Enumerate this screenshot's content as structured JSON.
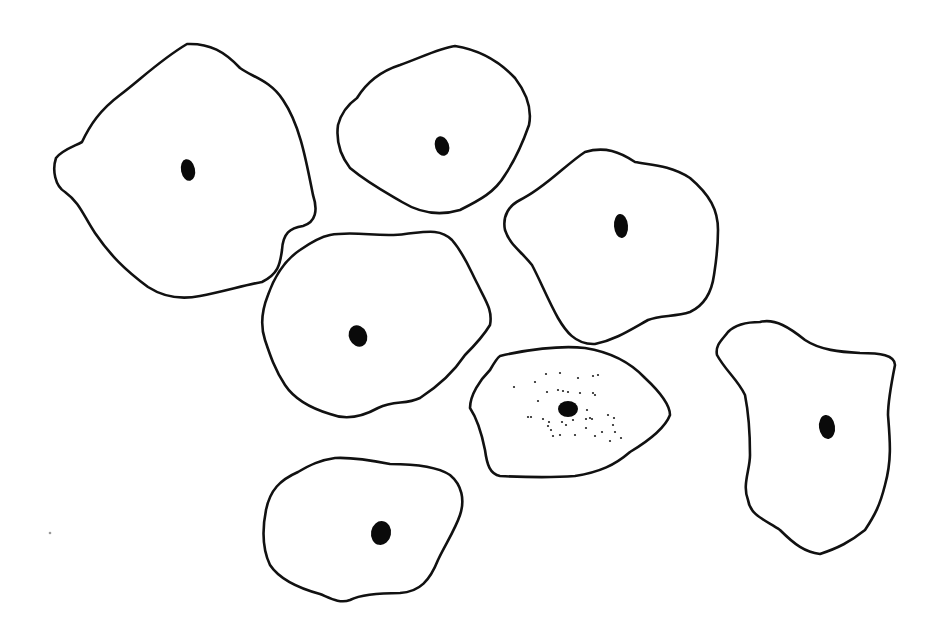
{
  "figure": {
    "width": 943,
    "height": 632,
    "background": "#ffffff",
    "line_color": "#111111",
    "cells": [
      {
        "id": "cell-top-left",
        "outline": "M 187,44 C 210,43 225,52 240,68 C 252,77 270,80 283,100 C 300,125 306,160 313,195 C 318,210 316,222 303,226 C 290,228 283,233 282,250 C 280,265 278,274 262,282 C 245,285 222,292 200,296 C 180,300 162,296 148,287 C 125,270 110,255 95,233 C 83,215 80,203 65,192 C 55,186 52,170 56,158 C 62,150 75,146 82,142 C 90,125 100,110 120,95 C 140,80 160,60 187,44 Z",
        "nucleus": {
          "cx": 188,
          "cy": 170,
          "rx": 7,
          "ry": 11,
          "rotate": -12
        },
        "granules": []
      },
      {
        "id": "cell-top-center",
        "outline": "M 455,46 C 480,50 500,62 515,78 C 528,95 532,110 529,125 C 522,145 515,160 505,175 C 495,192 480,200 460,210 C 440,216 420,213 402,202 C 385,192 368,183 350,168 C 340,155 336,140 338,125 C 342,110 350,103 357,98 C 365,85 378,72 400,65 C 420,58 440,48 455,46 Z",
        "nucleus": {
          "cx": 442,
          "cy": 146,
          "rx": 7,
          "ry": 10,
          "rotate": -18
        },
        "granules": []
      },
      {
        "id": "cell-mid-right",
        "outline": "M 585,152 C 605,146 620,152 635,162 C 650,165 670,165 690,178 C 710,195 718,210 718,230 C 718,250 716,262 714,275 C 712,290 705,305 690,312 C 675,317 660,315 648,320 C 630,330 615,340 595,344 C 575,345 565,330 558,318 C 548,300 540,280 532,265 C 520,250 510,245 505,230 C 502,215 510,205 520,200 C 545,188 565,165 585,152 Z",
        "nucleus": {
          "cx": 621,
          "cy": 226,
          "rx": 7,
          "ry": 12,
          "rotate": -5
        },
        "granules": []
      },
      {
        "id": "cell-center",
        "outline": "M 330,235 C 355,230 380,238 405,234 C 425,232 440,228 452,240 C 465,255 470,270 478,285 C 485,300 493,310 490,325 C 484,335 475,345 465,355 C 455,370 440,385 420,398 C 405,405 395,400 378,408 C 360,418 345,420 330,414 C 310,408 295,400 285,385 C 275,370 270,355 265,340 C 260,325 262,310 268,295 C 275,275 285,260 300,250 C 310,243 320,237 330,235 Z",
        "nucleus": {
          "cx": 358,
          "cy": 336,
          "rx": 9,
          "ry": 11,
          "rotate": -25
        },
        "granules": []
      },
      {
        "id": "cell-granular",
        "outline": "M 500,356 C 525,350 560,345 585,348 C 610,352 630,362 645,378 C 660,392 670,405 670,415 C 665,428 650,440 630,452 C 615,465 600,472 575,476 C 550,478 520,477 500,476 C 490,474 487,465 485,450 C 482,435 478,420 470,408 C 470,395 480,380 490,370 C 494,363 497,358 500,356 Z",
        "nucleus": {
          "cx": 568,
          "cy": 409,
          "rx": 10,
          "ry": 8,
          "rotate": 0
        },
        "granules": [
          [
            514,
            387
          ],
          [
            535,
            382
          ],
          [
            546,
            374
          ],
          [
            560,
            373
          ],
          [
            578,
            378
          ],
          [
            547,
            392
          ],
          [
            558,
            390
          ],
          [
            563,
            391
          ],
          [
            593,
            376
          ],
          [
            598,
            375
          ],
          [
            568,
            392
          ],
          [
            580,
            393
          ],
          [
            593,
            393
          ],
          [
            595,
            395
          ],
          [
            538,
            401
          ],
          [
            528,
            417
          ],
          [
            531,
            417
          ],
          [
            543,
            419
          ],
          [
            549,
            422
          ],
          [
            548,
            426
          ],
          [
            562,
            422
          ],
          [
            566,
            425
          ],
          [
            573,
            420
          ],
          [
            575,
            435
          ],
          [
            553,
            436
          ],
          [
            560,
            435
          ],
          [
            586,
            419
          ],
          [
            590,
            418
          ],
          [
            592,
            419
          ],
          [
            586,
            428
          ],
          [
            595,
            436
          ],
          [
            602,
            432
          ],
          [
            608,
            415
          ],
          [
            614,
            418
          ],
          [
            613,
            425
          ],
          [
            615,
            432
          ],
          [
            621,
            438
          ],
          [
            610,
            441
          ],
          [
            551,
            430
          ],
          [
            587,
            410
          ]
        ]
      },
      {
        "id": "cell-right",
        "outline": "M 760,322 C 775,318 790,328 805,340 C 820,350 840,352 860,353 C 880,353 895,355 895,365 C 892,380 888,400 888,415 C 890,440 892,460 885,485 C 880,505 875,515 865,530 C 850,542 838,548 820,554 C 805,552 795,545 780,530 C 765,520 750,515 748,500 C 742,485 750,470 750,455 C 750,435 748,410 745,395 C 738,380 725,370 717,355 C 715,345 722,340 728,332 C 735,325 748,322 760,322 Z",
        "nucleus": {
          "cx": 827,
          "cy": 427,
          "rx": 8,
          "ry": 12,
          "rotate": -8
        },
        "granules": []
      },
      {
        "id": "cell-bottom",
        "outline": "M 335,458 C 355,457 375,461 390,464 C 410,464 435,465 450,475 C 462,485 465,500 460,515 C 455,530 445,545 438,560 C 430,580 420,592 400,593 C 380,593 360,595 350,600 C 340,604 330,598 320,594 C 298,588 280,580 270,565 C 263,550 262,530 266,510 C 270,490 280,480 298,472 C 310,465 320,460 335,458 Z",
        "nucleus": {
          "cx": 381,
          "cy": 533,
          "rx": 10,
          "ry": 12,
          "rotate": 10
        },
        "granules": []
      }
    ],
    "stray_marks": [
      {
        "cx": 50,
        "cy": 533,
        "r": 1.3
      }
    ]
  }
}
